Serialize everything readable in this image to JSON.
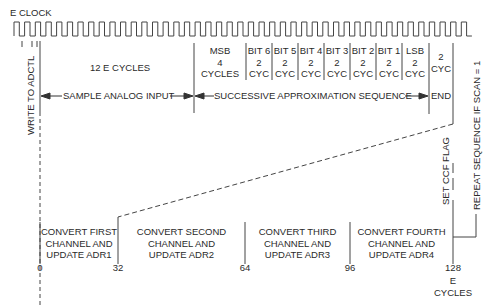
{
  "title": "E CLOCK",
  "clock": {
    "start_x": 14,
    "end_x": 480,
    "period": 10.65,
    "high_y": 22,
    "low_y": 36
  },
  "top_row": {
    "first": "12 E CYCLES",
    "msb": [
      "MSB",
      "4",
      "CYCLES"
    ],
    "bits": [
      {
        "l1": "BIT 6",
        "l2": "2",
        "l3": "CYC"
      },
      {
        "l1": "BIT 5",
        "l2": "2",
        "l3": "CYC"
      },
      {
        "l1": "BIT 4",
        "l2": "2",
        "l3": "CYC"
      },
      {
        "l1": "BIT 3",
        "l2": "2",
        "l3": "CYC"
      },
      {
        "l1": "BIT 2",
        "l2": "2",
        "l3": "CYC"
      },
      {
        "l1": "BIT 1",
        "l2": "2",
        "l3": "CYC"
      },
      {
        "l1": "LSB",
        "l2": "2",
        "l3": "CYC"
      }
    ],
    "end_cycles": [
      "2",
      "CYC"
    ]
  },
  "phases": {
    "sample": "SAMPLE ANALOG INPUT",
    "sar": "SUCCESSIVE APPROXIMATION SEQUENCE",
    "end": "END"
  },
  "vertical_labels": {
    "write": "WRITE TO ADCTL",
    "ccf": "SET CCF FLAG",
    "repeat": "REPEAT SEQUENCE IF SCAN = 1"
  },
  "channels": [
    {
      "l1": "CONVERT FIRST",
      "l2": "CHANNEL AND",
      "l3": "UPDATE ADR1"
    },
    {
      "l1": "CONVERT SECOND",
      "l2": "CHANNEL AND",
      "l3": "UPDATE ADR2"
    },
    {
      "l1": "CONVERT THIRD",
      "l2": "CHANNEL AND",
      "l3": "UPDATE ADR3"
    },
    {
      "l1": "CONVERT FOURTH",
      "l2": "CHANNEL AND",
      "l3": "UPDATE ADR4"
    }
  ],
  "ticks": [
    "0",
    "32",
    "64",
    "96",
    "128"
  ],
  "units": [
    "E",
    "CYCLES"
  ],
  "colors": {
    "line": "#3a3a3a",
    "text": "#2a2a2a",
    "background": "#ffffff"
  }
}
